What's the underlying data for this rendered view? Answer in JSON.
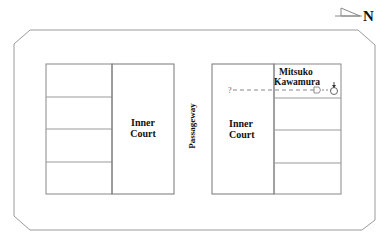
{
  "compass": {
    "label": "N",
    "icon": "north-arrow-icon"
  },
  "left_block": {
    "court_label_line1": "Inner",
    "court_label_line2": "Court",
    "room_count": 4
  },
  "passageway_label": "Passageway",
  "right_block": {
    "court_label_line1": "Inner",
    "court_label_line2": "Court",
    "room_count": 4,
    "occupant_line1": "Mitsuko",
    "occupant_line2": "Kawamura",
    "question_mark": "?",
    "footprints_icon": "footprints-icon",
    "person_icon": "person-icon"
  },
  "colors": {
    "line": "#8a8a8a",
    "text": "#111111"
  }
}
